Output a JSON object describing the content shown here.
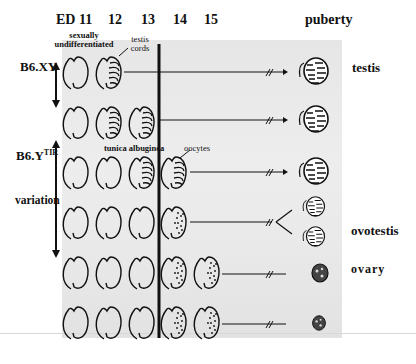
{
  "stages": {
    "ed11": "ED 11",
    "ed12": "12",
    "ed13": "13",
    "ed14": "14",
    "ed15": "15",
    "puberty": "puberty"
  },
  "annotations": {
    "sexually_undifferentiated_line1": "sexually",
    "sexually_undifferentiated_line2": "undifferentiated",
    "testis_cords_line1": "testis",
    "testis_cords_line2": "cords",
    "tunica_albuginea": "tunica albuginea",
    "oocytes": "oocytes"
  },
  "strains": {
    "b6xy": "B6.XY",
    "b6ytir_base": "B6.Y",
    "b6ytir_sup": "TIR",
    "variation": "variation"
  },
  "outcomes": {
    "testis": "testis",
    "ovotestis": "ovotestis",
    "ovary": "ovary"
  },
  "rows": [
    {
      "id": "row-1",
      "strain": "B6.XY",
      "stages_shown": [
        "ED11",
        "ED12"
      ],
      "outcome": "testis"
    },
    {
      "id": "row-2",
      "strain": "B6.XY",
      "stages_shown": [
        "ED11",
        "ED12",
        "ED13"
      ],
      "outcome": "testis"
    },
    {
      "id": "row-3",
      "strain": "B6.YTIR",
      "stages_shown": [
        "ED11",
        "ED12",
        "ED13",
        "ED14"
      ],
      "outcome": "testis"
    },
    {
      "id": "row-4",
      "strain": "B6.YTIR",
      "stages_shown": [
        "ED11",
        "ED12",
        "ED13",
        "ED14"
      ],
      "outcome": "ovotestis"
    },
    {
      "id": "row-5",
      "strain": "B6.YTIR",
      "stages_shown": [
        "ED11",
        "ED12",
        "ED13",
        "ED14",
        "ED15"
      ],
      "outcome": "ovary"
    },
    {
      "id": "row-6",
      "strain": "B6.YTIR",
      "stages_shown": [
        "ED11",
        "ED12",
        "ED13",
        "ED14",
        "ED15"
      ],
      "outcome": "ovary"
    }
  ],
  "colors": {
    "ink": "#111111",
    "panel": "#e8e8e8",
    "background": "#ffffff"
  }
}
